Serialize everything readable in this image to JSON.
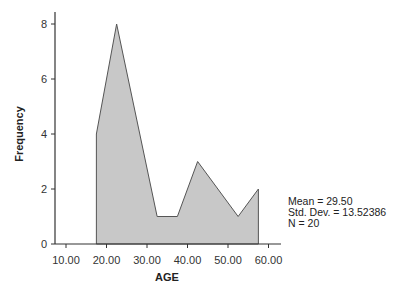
{
  "chart_data": {
    "type": "area",
    "subtype": "frequency-polygon",
    "title": "",
    "xlabel": "AGE",
    "ylabel": "Frequency",
    "x": [
      17.5,
      22.5,
      32.5,
      37.5,
      42.5,
      52.5,
      57.5
    ],
    "values": [
      4,
      8,
      1,
      1,
      3,
      1,
      2
    ],
    "xlim": [
      7.5,
      62.5
    ],
    "ylim": [
      0,
      8.5
    ],
    "xticks": [
      10,
      20,
      30,
      40,
      50,
      60
    ],
    "xtick_labels": [
      "10.00",
      "20.00",
      "30.00",
      "40.00",
      "50.00",
      "60.00"
    ],
    "yticks": [
      0,
      2,
      4,
      6,
      8
    ],
    "ytick_labels": [
      "0",
      "2",
      "4",
      "6",
      "8"
    ],
    "grid": false,
    "fill_color": "#c8c8c8",
    "line_color": "#555555",
    "annotations": [
      "Mean = 29.50",
      "Std. Dev. = 13.52386",
      "N = 20"
    ]
  },
  "stats": {
    "mean": "Mean = 29.50",
    "std": "Std. Dev. = 13.52386",
    "n": "N = 20"
  }
}
